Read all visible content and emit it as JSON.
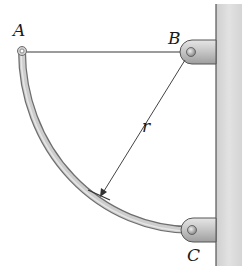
{
  "figure": {
    "labels": {
      "A": "A",
      "B": "B",
      "C": "C",
      "r": "r"
    },
    "colors": {
      "wall_fill": "#d9d9d9",
      "wall_edge": "#555555",
      "rod_fill": "#c8c8c8",
      "rod_edge": "#6e6e6e",
      "cable": "#7a7a7a",
      "bracket_fill": "#cfcfcf",
      "bracket_edge": "#555555",
      "dimension_line": "#444444",
      "label_color": "#1a1a1a"
    },
    "elements": [
      {
        "id": "wall",
        "description": "vertical wall on right side"
      },
      {
        "id": "bracket-B",
        "description": "pin support at B"
      },
      {
        "id": "bracket-C",
        "description": "pin support at C"
      },
      {
        "id": "cable-AB",
        "description": "straight horizontal member from A to B"
      },
      {
        "id": "curved-rod-AC",
        "description": "quarter-circle curved rod from A to C"
      },
      {
        "id": "radius-dimension",
        "description": "radius r from B to curved rod"
      }
    ]
  }
}
